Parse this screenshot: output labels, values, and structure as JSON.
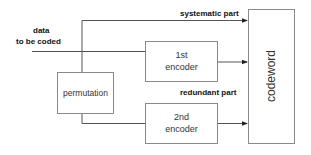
{
  "diagram": {
    "input_label_line1": "data",
    "input_label_line2": "to be coded",
    "systematic_label": "systematic part",
    "redundant_label": "redundant part",
    "blocks": {
      "permutation": "permutation",
      "encoder1_line1": "1st",
      "encoder1_line2": "encoder",
      "encoder2_line1": "2nd",
      "encoder2_line2": "encoder",
      "codeword": "codeword"
    },
    "colors": {
      "line": "#555555",
      "box_border": "#8a8a8a",
      "label": "#111111"
    }
  }
}
